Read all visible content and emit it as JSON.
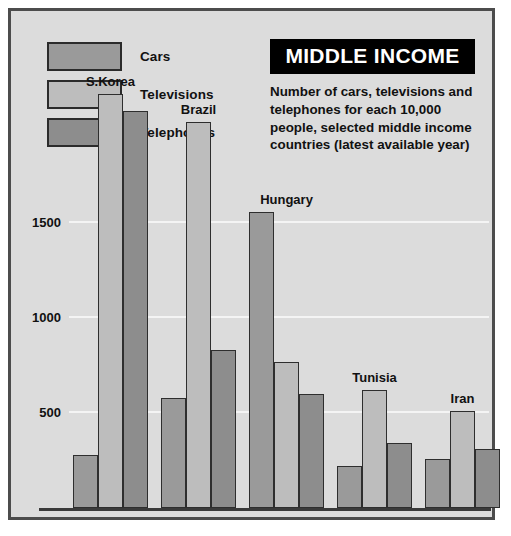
{
  "header": {
    "banner_title": "MIDDLE INCOME",
    "subtitle": "Number of cars, televisions and telephones for each 10,000 people, selected middle income countries (latest available year)"
  },
  "legend": {
    "items": [
      {
        "label": "Cars",
        "color": "#9a9a9a",
        "key": "cars"
      },
      {
        "label": "Televisions",
        "color": "#bdbdbd",
        "key": "televisions"
      },
      {
        "label": "Telephones",
        "color": "#8d8d8d",
        "key": "telephones"
      }
    ]
  },
  "axis": {
    "ticks": [
      "1500",
      "1000",
      "500"
    ]
  },
  "chart_data": {
    "type": "bar",
    "title": "MIDDLE INCOME",
    "subtitle": "Number of cars, televisions and telephones for each 10,000 people, selected middle income countries (latest available year)",
    "xlabel": "",
    "ylabel": "",
    "ylim": [
      0,
      2300
    ],
    "yticks": [
      500,
      1000,
      1500
    ],
    "grid": true,
    "legend_position": "top-left",
    "categories": [
      "S.Korea",
      "Brazil",
      "Hungary",
      "Tunisia",
      "Iran"
    ],
    "series": [
      {
        "name": "Cars",
        "color": "#9a9a9a",
        "values": [
          280,
          580,
          1560,
          220,
          260
        ]
      },
      {
        "name": "Televisions",
        "color": "#bdbdbd",
        "values": [
          2180,
          2030,
          770,
          620,
          510
        ]
      },
      {
        "name": "Telephones",
        "color": "#8d8d8d",
        "values": [
          2090,
          830,
          600,
          340,
          310
        ]
      }
    ]
  }
}
